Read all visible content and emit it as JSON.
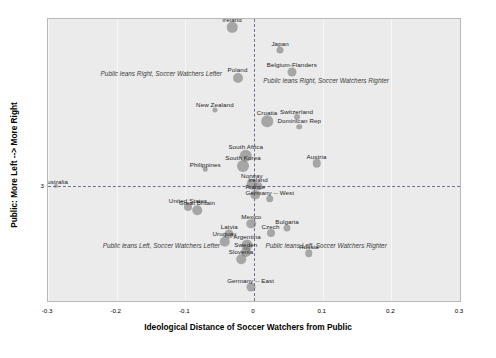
{
  "chart_data": {
    "type": "scatter",
    "title": "",
    "xlabel": "Ideological Distance of Soccer Watchers from Public",
    "ylabel": "Public: More Left --> More Right",
    "xlim": [
      -0.3,
      0.3
    ],
    "ylim": [
      1.9,
      4.6
    ],
    "xticks": [
      "-0.3",
      "-0.2",
      "-0.1",
      "0",
      "0.1",
      "0.2",
      "0.3"
    ],
    "xtick_values": [
      -0.3,
      -0.2,
      -0.1,
      0,
      0.1,
      0.2,
      0.3
    ],
    "yticks": [
      "3"
    ],
    "ytick_values": [
      3
    ],
    "grid": true,
    "reference_lines": {
      "x": 0,
      "y": 3
    },
    "legend": "none",
    "annotations": [
      {
        "text": "Public leans Right, Soccer Watchers Lefter",
        "x": -0.135,
        "y": 4.08
      },
      {
        "text": "Public leans Right, Soccer Watchers Righter",
        "x": 0.105,
        "y": 4.02
      },
      {
        "text": "Public leans Left, Soccer Watchers Lefter",
        "x": -0.135,
        "y": 2.44
      },
      {
        "text": "Public leans Left, Soccer Watchers Righter",
        "x": 0.105,
        "y": 2.44
      }
    ],
    "points": [
      {
        "label": "Ireland",
        "x": -0.032,
        "y": 4.52,
        "size": 10.5
      },
      {
        "label": "Japan",
        "x": 0.038,
        "y": 4.3,
        "size": 7.0
      },
      {
        "label": "Belgium-Flanders",
        "x": 0.055,
        "y": 4.09,
        "size": 9.0
      },
      {
        "label": "Poland",
        "x": -0.024,
        "y": 4.04,
        "size": 10.0
      },
      {
        "label": "New Zealand",
        "x": -0.057,
        "y": 3.73,
        "size": 5.0
      },
      {
        "label": "Croatia",
        "x": 0.019,
        "y": 3.62,
        "size": 11.5
      },
      {
        "label": "Switzerland",
        "x": 0.062,
        "y": 3.66,
        "size": 6.0
      },
      {
        "label": "Dominican Rep",
        "x": 0.066,
        "y": 3.57,
        "size": 5.5
      },
      {
        "label": "South Africa",
        "x": -0.012,
        "y": 3.29,
        "size": 12.5
      },
      {
        "label": "South Korea",
        "x": -0.016,
        "y": 3.19,
        "size": 12.0
      },
      {
        "label": "Austria",
        "x": 0.091,
        "y": 3.22,
        "size": 8.5
      },
      {
        "label": "Philippines",
        "x": -0.071,
        "y": 3.16,
        "size": 4.5
      },
      {
        "label": "Australia",
        "x": -0.289,
        "y": 3.0,
        "size": 4.0
      },
      {
        "label": "Norway",
        "x": -0.003,
        "y": 3.02,
        "size": 10.5
      },
      {
        "label": "Ireland ",
        "x": 0.006,
        "y": 3.0,
        "size": 7.5
      },
      {
        "label": "France",
        "x": 0.002,
        "y": 2.92,
        "size": 9.5
      },
      {
        "label": "Germany -- West",
        "x": 0.023,
        "y": 2.88,
        "size": 7.5
      },
      {
        "label": "United States",
        "x": -0.096,
        "y": 2.8,
        "size": 8.0
      },
      {
        "label": "Great Britain",
        "x": -0.083,
        "y": 2.77,
        "size": 9.5
      },
      {
        "label": "Mexico",
        "x": -0.004,
        "y": 2.64,
        "size": 9.5
      },
      {
        "label": "Czech",
        "x": 0.024,
        "y": 2.55,
        "size": 8.0
      },
      {
        "label": "Bulgaria",
        "x": 0.048,
        "y": 2.6,
        "size": 7.0
      },
      {
        "label": "Latvia",
        "x": -0.036,
        "y": 2.54,
        "size": 9.0
      },
      {
        "label": "Uruguay",
        "x": -0.043,
        "y": 2.47,
        "size": 10.5
      },
      {
        "label": "Argentina",
        "x": -0.01,
        "y": 2.44,
        "size": 11.0
      },
      {
        "label": "Sweden",
        "x": -0.012,
        "y": 2.37,
        "size": 10.0
      },
      {
        "label": "Slovenia",
        "x": -0.019,
        "y": 2.3,
        "size": 9.5
      },
      {
        "label": "Russia",
        "x": 0.08,
        "y": 2.36,
        "size": 7.5
      },
      {
        "label": "Germany -- East",
        "x": -0.005,
        "y": 2.03,
        "size": 9.0
      }
    ]
  }
}
